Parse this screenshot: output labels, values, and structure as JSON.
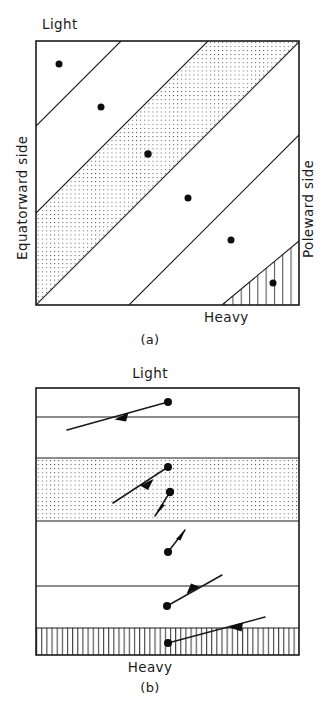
{
  "figure": {
    "panels": [
      {
        "id": "a",
        "caption": "(a)",
        "labels": {
          "top": "Light",
          "bottom": "Heavy",
          "left": "Equatorward side",
          "right": "Poleward side"
        },
        "box": {
          "x": 36,
          "y": 41,
          "width": 263,
          "height": 264
        },
        "band_orientation": "diagonal",
        "band_lines": [
          {
            "x1": 36,
            "y1": 126,
            "x2": 121,
            "y2": 41
          },
          {
            "x1": 36,
            "y1": 213,
            "x2": 208,
            "y2": 41
          },
          {
            "x1": 36,
            "y1": 305,
            "x2": 299,
            "y2": 42
          },
          {
            "x1": 129,
            "y1": 305,
            "x2": 299,
            "y2": 135
          },
          {
            "x1": 222,
            "y1": 305,
            "x2": 299,
            "y2": 241
          }
        ],
        "shaded_regions": [
          {
            "name": "stippled-band",
            "pattern": "dots",
            "points": "36,213 208,41 299,42 36,305"
          },
          {
            "name": "hatched-triangle",
            "pattern": "vertical-hatch",
            "points": "222,305 299,241 299,305"
          }
        ],
        "stations": [
          {
            "x": 59,
            "y": 64
          },
          {
            "x": 101,
            "y": 107
          },
          {
            "x": 148,
            "y": 154
          },
          {
            "x": 188,
            "y": 198
          },
          {
            "x": 231,
            "y": 240
          },
          {
            "x": 273,
            "y": 283
          }
        ]
      },
      {
        "id": "b",
        "caption": "(b)",
        "labels": {
          "top": "Light",
          "bottom": "Heavy"
        },
        "box": {
          "x": 36,
          "y": 388,
          "width": 263,
          "height": 267
        },
        "band_orientation": "horizontal",
        "band_lines": [
          {
            "x1": 36,
            "y1": 417,
            "x2": 299,
            "y2": 417
          },
          {
            "x1": 36,
            "y1": 458,
            "x2": 299,
            "y2": 458
          },
          {
            "x1": 36,
            "y1": 521,
            "x2": 299,
            "y2": 521
          },
          {
            "x1": 36,
            "y1": 586,
            "x2": 299,
            "y2": 586
          },
          {
            "x1": 36,
            "y1": 628,
            "x2": 299,
            "y2": 628
          }
        ],
        "shaded_regions": [
          {
            "name": "stippled-band",
            "pattern": "dots",
            "points": "36,458 299,458 299,521 36,521"
          },
          {
            "name": "hatched-band",
            "pattern": "vertical-hatch",
            "points": "36,628 299,628 299,655 36,655"
          }
        ],
        "stations": [
          {
            "x": 168,
            "y": 402
          },
          {
            "x": 168,
            "y": 467
          },
          {
            "x": 170,
            "y": 492
          },
          {
            "x": 168,
            "y": 552
          },
          {
            "x": 167,
            "y": 606
          },
          {
            "x": 168,
            "y": 643
          }
        ],
        "vectors": [
          {
            "name": "vector-1",
            "x1": 168,
            "y1": 402,
            "x2": 67,
            "y2": 430,
            "head_t": 0.46,
            "head_dir": "tail"
          },
          {
            "name": "vector-2",
            "x1": 168,
            "y1": 467,
            "x2": 113,
            "y2": 503,
            "head_t": 0.42,
            "head_dir": "tail"
          },
          {
            "name": "vector-3",
            "x1": 170,
            "y1": 492,
            "x2": 155,
            "y2": 516,
            "head_t": 0.95,
            "head_dir": "tail"
          },
          {
            "name": "vector-4",
            "x1": 168,
            "y1": 552,
            "x2": 185,
            "y2": 530,
            "head_t": 0.95,
            "head_dir": "head"
          },
          {
            "name": "vector-5",
            "x1": 167,
            "y1": 606,
            "x2": 222,
            "y2": 575,
            "head_t": 0.56,
            "head_dir": "head"
          },
          {
            "name": "vector-6",
            "x1": 168,
            "y1": 643,
            "x2": 265,
            "y2": 617,
            "head_t": 0.72,
            "head_dir": "tail"
          }
        ]
      }
    ]
  }
}
